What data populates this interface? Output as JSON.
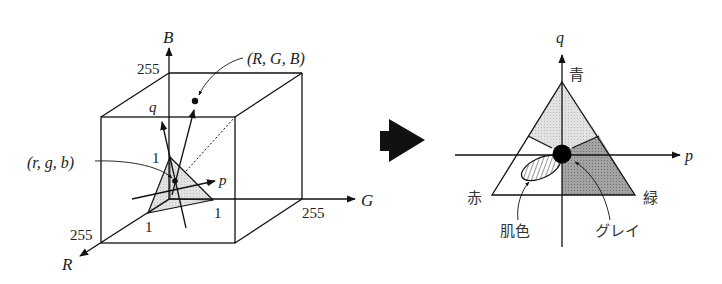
{
  "left_diagram": {
    "axes": {
      "R": "R",
      "G": "G",
      "B": "B",
      "p": "p",
      "q": "q"
    },
    "ticks": {
      "B_max": "255",
      "G_max": "255",
      "R_max": "255",
      "unit_r": "1",
      "unit_g": "1",
      "unit_b": "1"
    },
    "annotations": {
      "rgb_point": "(R, G, B)",
      "normalized_point": "(r, g, b)"
    }
  },
  "arrow": {
    "direction": "right"
  },
  "right_diagram": {
    "axes": {
      "p": "p",
      "q": "q"
    },
    "vertices": {
      "top": "青",
      "left": "赤",
      "right": "緑"
    },
    "regions": {
      "skin": "肌色",
      "gray": "グレイ"
    },
    "colors": {
      "blue_region": "#d6d6d6",
      "green_region": "#9a9a9a",
      "red_region": "#ffffff",
      "gray_dot": "#000000"
    }
  }
}
